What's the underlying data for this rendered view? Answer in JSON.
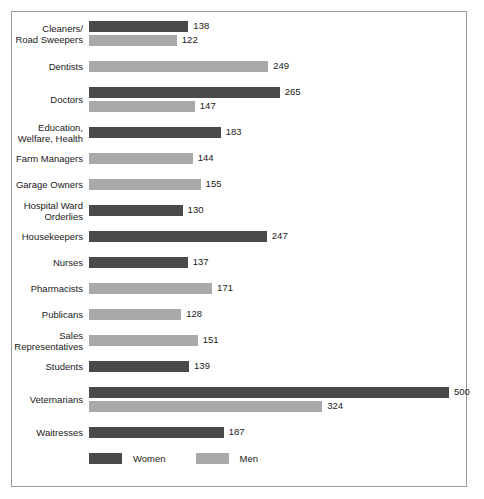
{
  "chart_data": {
    "type": "bar",
    "orientation": "horizontal",
    "title": "",
    "subtitle": "",
    "xlabel": "",
    "ylabel": "",
    "xlim": [
      0,
      500
    ],
    "grid": false,
    "legend_position": "bottom-left",
    "categories": [
      "Cleaners/\nRoad Sweepers",
      "Dentists",
      "Doctors",
      "Education,\nWelfare, Health",
      "Farm Managers",
      "Garage Owners",
      "Hospital Ward\nOrderlies",
      "Housekeepers",
      "Nurses",
      "Pharmacists",
      "Publicans",
      "Sales\nRepresentatives",
      "Students",
      "Veternarians",
      "Waitresses"
    ],
    "series": [
      {
        "name": "Women",
        "color": "#4a4a4a",
        "values": [
          138,
          null,
          265,
          183,
          null,
          null,
          130,
          247,
          137,
          null,
          null,
          null,
          139,
          500,
          187
        ]
      },
      {
        "name": "Men",
        "color": "#a9a9a9",
        "values": [
          122,
          249,
          147,
          null,
          144,
          155,
          null,
          null,
          null,
          171,
          128,
          151,
          null,
          324,
          null
        ]
      }
    ]
  },
  "legend": {
    "items": [
      {
        "label": "Women",
        "swatch": "women"
      },
      {
        "label": "Men",
        "swatch": "men"
      }
    ]
  }
}
